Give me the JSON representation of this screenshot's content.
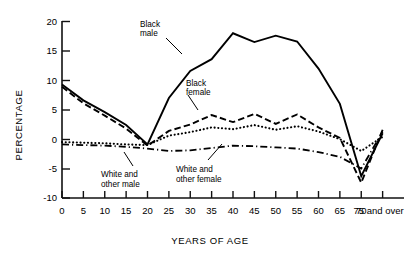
{
  "chart_data": {
    "type": "line",
    "title": "",
    "xlabel": "YEARS OF AGE",
    "ylabel": "PERCENTAGE",
    "xlim": [
      0,
      80
    ],
    "ylim": [
      -10,
      20
    ],
    "grid": false,
    "legend_position": "inline-annotations",
    "x": [
      0,
      5,
      10,
      15,
      20,
      25,
      30,
      35,
      40,
      45,
      50,
      55,
      60,
      65,
      70,
      75
    ],
    "xtick_labels": [
      "0",
      "5",
      "10",
      "15",
      "20",
      "25",
      "30",
      "35",
      "40",
      "45",
      "50",
      "55",
      "60",
      "65",
      "70",
      "75 and over"
    ],
    "ytick_labels": [
      "20",
      "15",
      "10",
      "5",
      "0",
      "-5",
      "-10"
    ],
    "ytick_values": [
      20,
      15,
      10,
      5,
      0,
      -5,
      -10
    ],
    "series": [
      {
        "name": "Black male",
        "style": "solid",
        "annotation": "Black\nmale",
        "values": [
          9.3,
          6.6,
          4.6,
          2.4,
          -0.9,
          7.0,
          11.6,
          13.6,
          18.0,
          16.5,
          17.6,
          16.6,
          12.0,
          6.0,
          -6.3,
          1.0
        ]
      },
      {
        "name": "Black female",
        "style": "dashed",
        "annotation": "Black\nfemale",
        "values": [
          8.9,
          6.1,
          4.0,
          1.8,
          -1.1,
          1.4,
          2.5,
          4.1,
          2.9,
          4.3,
          2.6,
          4.2,
          2.0,
          0.2,
          -7.4,
          1.6
        ]
      },
      {
        "name": "White and other female",
        "style": "dotted",
        "annotation": "White and\nother female",
        "values": [
          -0.5,
          -0.6,
          -0.7,
          -0.9,
          -1.0,
          0.6,
          1.2,
          2.0,
          1.7,
          2.4,
          1.6,
          2.2,
          1.3,
          0.0,
          -2.0,
          0.4
        ]
      },
      {
        "name": "White and other male",
        "style": "dashdot",
        "annotation": "White and\nother male",
        "values": [
          -0.9,
          -1.0,
          -1.1,
          -1.3,
          -1.6,
          -2.0,
          -1.9,
          -1.5,
          -1.1,
          -1.2,
          -1.4,
          -1.6,
          -2.2,
          -3.0,
          -5.0,
          1.3
        ]
      }
    ],
    "annotations": [
      {
        "id": "black-male",
        "label_line1": "Black",
        "label_line2": "male"
      },
      {
        "id": "black-female",
        "label_line1": "Black",
        "label_line2": "female"
      },
      {
        "id": "white-other-male",
        "label_line1": "White and",
        "label_line2": "other male"
      },
      {
        "id": "white-other-female",
        "label_line1": "White and",
        "label_line2": "other female"
      }
    ]
  },
  "axes": {
    "y_title": "PERCENTAGE",
    "x_title": "YEARS OF AGE"
  }
}
